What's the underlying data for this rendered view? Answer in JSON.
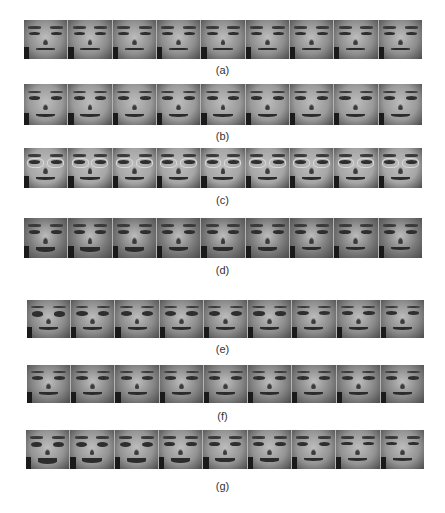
{
  "figure": {
    "rows": [
      {
        "id": "a",
        "label": "(a)",
        "frames": 9,
        "expression": "neutral",
        "tone": "#8e8e8e",
        "glasses": false
      },
      {
        "id": "b",
        "label": "(b)",
        "frames": 9,
        "expression": "slight smile",
        "tone": "#9a9a9a",
        "glasses": false
      },
      {
        "id": "c",
        "label": "(c)",
        "frames": 9,
        "expression": "smile with glasses",
        "tone": "#a6a6a6",
        "glasses": true
      },
      {
        "id": "d",
        "label": "(d)",
        "frames": 9,
        "expression": "smile fading",
        "tone": "#7a7a7a",
        "glasses": false
      },
      {
        "id": "e",
        "label": "(e)",
        "frames": 9,
        "expression": "surprise fading",
        "tone": "#8a8a8a",
        "glasses": false
      },
      {
        "id": "f",
        "label": "(f)",
        "frames": 9,
        "expression": "smile",
        "tone": "#858585",
        "glasses": false
      },
      {
        "id": "g",
        "label": "(g)",
        "frames": 9,
        "expression": "big smile fading",
        "tone": "#949494",
        "glasses": false
      }
    ]
  },
  "labels": {
    "a": "(a)",
    "b": "(b)",
    "c": "(c)",
    "d": "(d)",
    "e": "(e)",
    "f": "(f)",
    "g": "(g)"
  }
}
